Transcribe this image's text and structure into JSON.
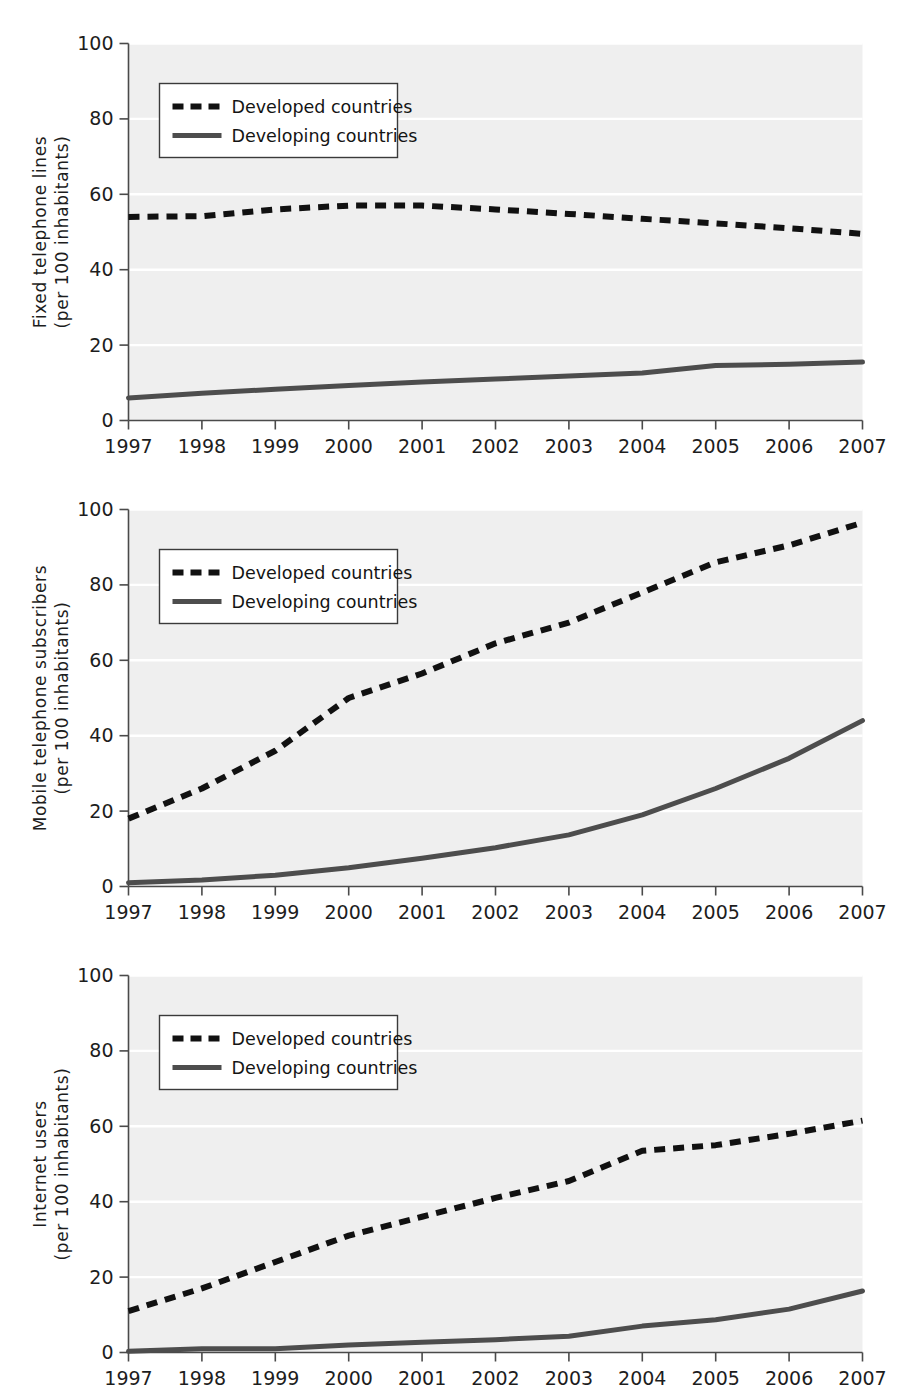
{
  "figure": {
    "panel_count": 3,
    "colors": {
      "plot_background": "#efefef",
      "gridline": "#ffffff",
      "axis": "#4a4a4a",
      "developed_series": "#111111",
      "developing_series": "#4d4d4d",
      "legend_background": "#ffffff",
      "legend_border": "#3a3a3a",
      "text": "#1d1d1d"
    }
  },
  "legend": {
    "position": "upper-left",
    "entries": [
      {
        "label": "Developed countries",
        "style": "dashed",
        "swatch": "dashed-line-swatch"
      },
      {
        "label": "Developing countries",
        "style": "solid",
        "swatch": "solid-line-swatch"
      }
    ]
  },
  "chart_data": [
    {
      "type": "line",
      "title": "",
      "xlabel": "",
      "ylabel": "Fixed telephone lines\n(per 100 inhabitants)",
      "ylabel_line1": "Fixed telephone lines",
      "ylabel_line2": "(per 100 inhabitants)",
      "x": [
        1997,
        1998,
        1999,
        2000,
        2001,
        2002,
        2003,
        2004,
        2005,
        2006,
        2007
      ],
      "categories": [
        "1997",
        "1998",
        "1999",
        "2000",
        "2001",
        "2002",
        "2003",
        "2004",
        "2005",
        "2006",
        "2007"
      ],
      "xlim": [
        1997,
        2007
      ],
      "ylim": [
        0,
        100
      ],
      "yticks": [
        0,
        20,
        40,
        60,
        80,
        100
      ],
      "ytick_labels": [
        "0",
        "20",
        "40",
        "60",
        "80",
        "100"
      ],
      "grid": true,
      "legend_position": "upper-left",
      "series": [
        {
          "name": "Developed countries",
          "style": "dashed",
          "values": [
            54.0,
            54.2,
            56.0,
            57.0,
            57.0,
            56.0,
            54.8,
            53.5,
            52.3,
            51.0,
            49.5
          ]
        },
        {
          "name": "Developing countries",
          "style": "solid",
          "values": [
            6.0,
            7.2,
            8.3,
            9.3,
            10.2,
            11.0,
            11.8,
            12.6,
            14.6,
            14.9,
            15.5
          ]
        }
      ]
    },
    {
      "type": "line",
      "title": "",
      "xlabel": "",
      "ylabel": "Mobile telephone subscribers\n(per 100 inhabitants)",
      "ylabel_line1": "Mobile telephone subscribers",
      "ylabel_line2": "(per 100 inhabitants)",
      "x": [
        1997,
        1998,
        1999,
        2000,
        2001,
        2002,
        2003,
        2004,
        2005,
        2006,
        2007
      ],
      "categories": [
        "1997",
        "1998",
        "1999",
        "2000",
        "2001",
        "2002",
        "2003",
        "2004",
        "2005",
        "2006",
        "2007"
      ],
      "xlim": [
        1997,
        2007
      ],
      "ylim": [
        0,
        100
      ],
      "yticks": [
        0,
        20,
        40,
        60,
        80,
        100
      ],
      "ytick_labels": [
        "0",
        "20",
        "40",
        "60",
        "80",
        "100"
      ],
      "grid": true,
      "legend_position": "upper-left",
      "series": [
        {
          "name": "Developed countries",
          "style": "dashed",
          "values": [
            18.0,
            26.0,
            36.0,
            50.0,
            56.5,
            64.5,
            70.0,
            78.0,
            86.0,
            90.5,
            96.5
          ]
        },
        {
          "name": "Developing countries",
          "style": "solid",
          "values": [
            1.0,
            1.7,
            3.0,
            5.0,
            7.5,
            10.3,
            13.7,
            19.0,
            26.0,
            34.0,
            44.0
          ]
        }
      ]
    },
    {
      "type": "line",
      "title": "",
      "xlabel": "",
      "ylabel": "Internet users\n(per 100 inhabitants)",
      "ylabel_line1": "Internet users",
      "ylabel_line2": "(per 100 inhabitants)",
      "x": [
        1997,
        1998,
        1999,
        2000,
        2001,
        2002,
        2003,
        2004,
        2005,
        2006,
        2007
      ],
      "categories": [
        "1997",
        "1998",
        "1999",
        "2000",
        "2001",
        "2002",
        "2003",
        "2004",
        "2005",
        "2006",
        "2007"
      ],
      "xlim": [
        1997,
        2007
      ],
      "ylim": [
        0,
        100
      ],
      "yticks": [
        0,
        20,
        40,
        60,
        80,
        100
      ],
      "ytick_labels": [
        "0",
        "20",
        "40",
        "60",
        "80",
        "100"
      ],
      "grid": true,
      "legend_position": "upper-left",
      "series": [
        {
          "name": "Developed countries",
          "style": "dashed",
          "values": [
            11.0,
            17.0,
            24.0,
            31.0,
            36.0,
            41.0,
            45.5,
            53.5,
            55.0,
            58.0,
            61.5
          ]
        },
        {
          "name": "Developing countries",
          "style": "solid",
          "values": [
            0.3,
            1.0,
            1.0,
            2.0,
            2.7,
            3.4,
            4.3,
            7.0,
            8.7,
            11.5,
            16.3
          ]
        }
      ]
    }
  ]
}
